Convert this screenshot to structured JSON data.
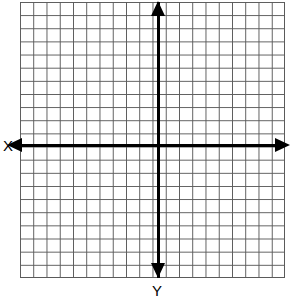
{
  "figure": {
    "kind": "cartesian-coordinate-grid",
    "title": "",
    "background_color": "#ffffff",
    "grid": {
      "line_color": "#5a5a5a",
      "cell_width_px": 13.25,
      "cell_height_px": 13.15,
      "columns": 20,
      "rows": 21,
      "left_px": 20,
      "top_px": 2,
      "width_px": 265,
      "height_px": 276
    },
    "axes": {
      "color": "#000000",
      "thickness_px": 3,
      "origin_x_px": 158,
      "origin_y_px": 145,
      "x_axis": {
        "label": "X",
        "label_position": "left",
        "arrow_start": "left",
        "arrow_end": "right",
        "double_headed": true
      },
      "y_axis": {
        "label": "Y",
        "label_position": "bottom",
        "arrow_start": "down",
        "arrow_end": "up",
        "double_headed": true
      }
    },
    "tick_labels": [],
    "plotted_data": []
  },
  "chart_data": {
    "type": "scatter",
    "title": "",
    "subtitle": "",
    "xlabel": "X",
    "ylabel": "Y",
    "xlim": [
      -10,
      10
    ],
    "ylim": [
      -10,
      11
    ],
    "x_tick_labels": [],
    "y_tick_labels": [],
    "grid": true,
    "grid_step": 1,
    "legend": [],
    "legend_position": "none",
    "annotations": [],
    "series": [
      {
        "name": "",
        "x": [],
        "y": []
      }
    ]
  }
}
